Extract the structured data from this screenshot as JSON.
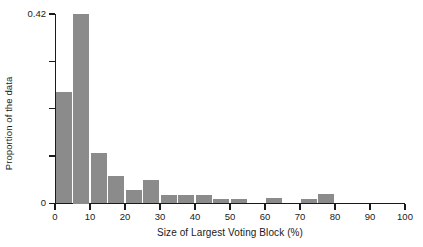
{
  "chart_data": {
    "type": "bar",
    "title": "",
    "subtitle": "",
    "xlabel": "Size of Largest Voting Block (%)",
    "ylabel": "Proportion of the data",
    "grid": false,
    "legend": "none",
    "bin_width": 5,
    "xlim": [
      0,
      100
    ],
    "ylim": [
      0,
      0.42
    ],
    "x_ticks": [
      0,
      10,
      20,
      30,
      40,
      50,
      60,
      70,
      80,
      90,
      100
    ],
    "x_tick_labels": [
      "0",
      "10",
      "20",
      "30",
      "40",
      "50",
      "60",
      "70",
      "80",
      "90",
      "100"
    ],
    "y_ticks": [
      0,
      0.105,
      0.21,
      0.315,
      0.42
    ],
    "y_tick_labels": [
      "0",
      "",
      "",
      "",
      "0.42"
    ],
    "categories": [
      "0-5",
      "5-10",
      "10-15",
      "15-20",
      "20-25",
      "25-30",
      "30-35",
      "35-40",
      "40-45",
      "45-50",
      "50-55",
      "55-60",
      "60-65",
      "65-70",
      "70-75",
      "75-80",
      "80-85",
      "85-90",
      "90-95",
      "95-100"
    ],
    "bin_starts": [
      0,
      5,
      10,
      15,
      20,
      25,
      30,
      35,
      40,
      45,
      50,
      55,
      60,
      65,
      70,
      75,
      80,
      85,
      90,
      95
    ],
    "values": [
      0.247,
      0.42,
      0.113,
      0.062,
      0.031,
      0.051,
      0.018,
      0.018,
      0.018,
      0.009,
      0.009,
      0.0,
      0.013,
      0.0,
      0.009,
      0.022,
      0.0,
      0.0,
      0.0,
      0.0
    ],
    "bar_color": "#8b8b8b",
    "axis_color": "#1a1a1a",
    "background_color": "#ffffff"
  }
}
